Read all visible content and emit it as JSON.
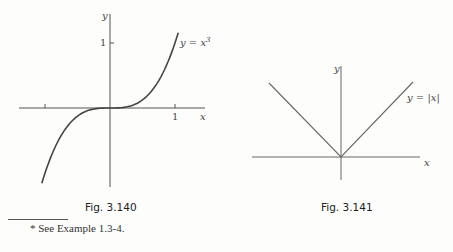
{
  "chart_data": [
    {
      "type": "line",
      "title": "Fig. 3.140",
      "series": [
        {
          "name": "y = x^3",
          "function": "x^3",
          "x_range": [
            -1.05,
            1.05
          ]
        }
      ],
      "xlabel": "x",
      "ylabel": "y",
      "x_ticks": [
        {
          "value": -1,
          "label": ""
        },
        {
          "value": 1,
          "label": "1"
        }
      ],
      "y_ticks": [
        {
          "value": 1,
          "label": "1"
        }
      ],
      "curve_label": "y = x³",
      "grid": false
    },
    {
      "type": "line",
      "title": "Fig. 3.141",
      "series": [
        {
          "name": "y = |x|",
          "function": "|x|",
          "points": [
            [
              -1,
              1
            ],
            [
              0,
              0
            ],
            [
              1,
              1
            ]
          ]
        }
      ],
      "xlabel": "x",
      "ylabel": "y",
      "curve_label": "y = |x|",
      "grid": false
    }
  ],
  "fig1": {
    "caption": "Fig. 3.140",
    "curve_label_base": "y = x",
    "curve_label_exp": "3",
    "y_label": "y",
    "x_label": "x",
    "tick_y1": "1",
    "tick_x1": "1"
  },
  "fig2": {
    "caption": "Fig. 3.141",
    "curve_label": "y = |x|",
    "y_label": "y",
    "x_label": "x"
  },
  "footnote": "* See Example 1.3-4."
}
